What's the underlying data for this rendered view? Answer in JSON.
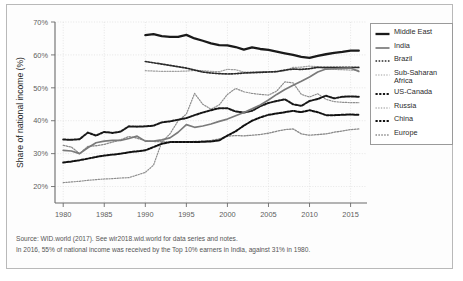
{
  "chart_data": {
    "type": "line",
    "title": "",
    "xlabel": "",
    "ylabel": "Share of national income (%)",
    "xlim": [
      1979,
      2017
    ],
    "ylim": [
      15,
      70
    ],
    "yticks": [
      20,
      30,
      40,
      50,
      60,
      70
    ],
    "ytick_labels": [
      "20%",
      "30%",
      "40%",
      "50%",
      "60%",
      "70%"
    ],
    "xticks": [
      1980,
      1985,
      1990,
      1995,
      2000,
      2005,
      2010,
      2015
    ],
    "xtick_labels": [
      "1980",
      "1985",
      "1990",
      "1995",
      "2000",
      "2005",
      "2010",
      "2015"
    ],
    "grid": true,
    "legend_position": "right",
    "series": [
      {
        "name": "Middle East",
        "style": "solid-thick",
        "color": "#1a1a1a",
        "x": [
          1990,
          1991,
          1992,
          1993,
          1994,
          1995,
          1996,
          1997,
          1998,
          1999,
          2000,
          2001,
          2002,
          2003,
          2004,
          2005,
          2006,
          2007,
          2008,
          2009,
          2010,
          2011,
          2012,
          2013,
          2014,
          2015,
          2016
        ],
        "values": [
          66.0,
          66.3,
          65.7,
          65.5,
          65.5,
          66.1,
          65.0,
          64.3,
          63.5,
          63.0,
          62.9,
          62.4,
          61.6,
          62.3,
          61.8,
          61.5,
          61.0,
          60.5,
          60.0,
          59.4,
          59.1,
          59.7,
          60.2,
          60.6,
          60.9,
          61.3,
          61.3
        ]
      },
      {
        "name": "India",
        "style": "solid-medium",
        "color": "#7a7a7a",
        "x": [
          1980,
          1981,
          1982,
          1983,
          1984,
          1985,
          1986,
          1987,
          1988,
          1989,
          1990,
          1991,
          1992,
          1993,
          1994,
          1995,
          1996,
          1997,
          1998,
          1999,
          2000,
          2001,
          2002,
          2003,
          2004,
          2005,
          2006,
          2007,
          2008,
          2009,
          2010,
          2011,
          2012,
          2013,
          2014,
          2015,
          2016
        ],
        "values": [
          31.0,
          30.8,
          30.0,
          31.8,
          33.3,
          33.8,
          34.0,
          34.0,
          34.6,
          35.3,
          33.8,
          33.8,
          34.2,
          34.8,
          36.5,
          38.8,
          38.0,
          38.4,
          39.0,
          39.8,
          40.5,
          41.5,
          42.5,
          43.6,
          44.8,
          46.3,
          48.0,
          49.5,
          50.8,
          52.0,
          53.3,
          54.8,
          55.7,
          55.8,
          55.9,
          56.0,
          55.0
        ]
      },
      {
        "name": "Brazil",
        "style": "dotted-bold",
        "color": "#2a2a2a",
        "x": [
          1990,
          1991,
          1992,
          1993,
          1994,
          1995,
          1996,
          1997,
          1998,
          1999,
          2000,
          2001,
          2002,
          2003,
          2004,
          2005,
          2006,
          2007,
          2008,
          2009,
          2010,
          2011,
          2012,
          2013,
          2014,
          2015,
          2016
        ],
        "values": [
          58.0,
          57.6,
          57.2,
          56.8,
          56.4,
          56.0,
          55.4,
          54.8,
          54.5,
          54.3,
          54.2,
          54.3,
          54.5,
          54.6,
          54.7,
          54.8,
          54.9,
          55.4,
          55.7,
          55.6,
          55.8,
          56.2,
          56.2,
          56.2,
          56.2,
          56.2,
          56.2
        ]
      },
      {
        "name": "Sub-Saharan Africa",
        "style": "dotted-light",
        "color": "#9f9f9f",
        "x": [
          1990,
          1991,
          1992,
          1993,
          1994,
          1995,
          1996,
          1997,
          1998,
          1999,
          2000,
          2001,
          2002,
          2003,
          2004,
          2005,
          2006,
          2007,
          2008,
          2009,
          2010,
          2011,
          2012,
          2013,
          2014,
          2015,
          2016
        ],
        "values": [
          55.2,
          55.1,
          55.0,
          55.0,
          55.0,
          55.1,
          55.3,
          55.2,
          55.0,
          54.9,
          55.6,
          55.5,
          54.8,
          54.8,
          54.9,
          54.9,
          55.0,
          55.2,
          56.2,
          56.3,
          56.6,
          56.4,
          55.8,
          55.6,
          55.5,
          55.4,
          55.3
        ]
      },
      {
        "name": "US-Canada",
        "style": "dashed-bold",
        "color": "#181818",
        "x": [
          1980,
          1981,
          1982,
          1983,
          1984,
          1985,
          1986,
          1987,
          1988,
          1989,
          1990,
          1991,
          1992,
          1993,
          1994,
          1995,
          1996,
          1997,
          1998,
          1999,
          2000,
          2001,
          2002,
          2003,
          2004,
          2005,
          2006,
          2007,
          2008,
          2009,
          2010,
          2011,
          2012,
          2013,
          2014,
          2015,
          2016
        ],
        "values": [
          34.3,
          34.2,
          34.4,
          36.4,
          35.5,
          36.6,
          36.3,
          36.7,
          38.3,
          38.2,
          38.3,
          38.5,
          39.5,
          39.8,
          40.3,
          40.8,
          41.7,
          42.5,
          43.2,
          43.8,
          43.8,
          42.8,
          42.5,
          43.0,
          44.4,
          45.4,
          46.0,
          46.5,
          45.0,
          44.5,
          46.0,
          46.6,
          47.6,
          46.8,
          47.3,
          47.4,
          47.3
        ]
      },
      {
        "name": "Russia",
        "style": "dotted-light",
        "color": "#8e8e8e",
        "x": [
          1980,
          1981,
          1982,
          1983,
          1984,
          1985,
          1986,
          1987,
          1988,
          1989,
          1990,
          1991,
          1992,
          1993,
          1994,
          1995,
          1996,
          1997,
          1998,
          1999,
          2000,
          2001,
          2002,
          2003,
          2004,
          2005,
          2006,
          2007,
          2008,
          2009,
          2010,
          2011,
          2012,
          2013,
          2014,
          2015,
          2016
        ],
        "values": [
          21.2,
          21.4,
          21.6,
          21.9,
          22.1,
          22.3,
          22.4,
          22.6,
          22.7,
          23.5,
          24.3,
          26.5,
          33.5,
          36.0,
          40.0,
          42.0,
          48.3,
          45.0,
          43.5,
          44.8,
          48.0,
          49.8,
          48.8,
          48.3,
          48.0,
          47.8,
          49.0,
          51.8,
          51.5,
          48.0,
          47.2,
          48.2,
          46.5,
          45.8,
          45.6,
          45.5,
          45.5
        ]
      },
      {
        "name": "China",
        "style": "dashed-bold",
        "color": "#111111",
        "x": [
          1980,
          1981,
          1982,
          1983,
          1984,
          1985,
          1986,
          1987,
          1988,
          1989,
          1990,
          1991,
          1992,
          1993,
          1994,
          1995,
          1996,
          1997,
          1998,
          1999,
          2000,
          2001,
          2002,
          2003,
          2004,
          2005,
          2006,
          2007,
          2008,
          2009,
          2010,
          2011,
          2012,
          2013,
          2014,
          2015,
          2016
        ],
        "values": [
          27.3,
          27.6,
          28.0,
          28.5,
          29.0,
          29.4,
          29.7,
          30.0,
          30.4,
          30.7,
          31.0,
          32.0,
          33.0,
          33.5,
          33.5,
          33.5,
          33.5,
          33.6,
          33.7,
          34.0,
          35.5,
          36.8,
          38.5,
          40.0,
          41.0,
          41.8,
          42.2,
          42.6,
          43.0,
          42.6,
          43.2,
          42.6,
          41.7,
          41.7,
          41.8,
          41.9,
          41.8
        ]
      },
      {
        "name": "Europe",
        "style": "dotted-medium",
        "color": "#8a8a8a",
        "x": [
          1980,
          1981,
          1982,
          1983,
          1984,
          1985,
          1986,
          1987,
          1988,
          1989,
          1990,
          1991,
          1992,
          1993,
          1994,
          1995,
          1996,
          1997,
          1998,
          1999,
          2000,
          2001,
          2002,
          2003,
          2004,
          2005,
          2006,
          2007,
          2008,
          2009,
          2010,
          2011,
          2012,
          2013,
          2014,
          2015,
          2016
        ],
        "values": [
          32.5,
          32.0,
          30.0,
          32.2,
          32.4,
          32.8,
          33.5,
          34.2,
          35.2,
          34.7,
          33.9,
          33.7,
          33.6,
          33.5,
          33.5,
          33.6,
          33.7,
          33.8,
          34.0,
          34.5,
          35.3,
          35.5,
          35.4,
          35.6,
          35.8,
          36.2,
          36.8,
          37.3,
          37.5,
          36.0,
          35.6,
          35.8,
          36.0,
          36.5,
          36.9,
          37.3,
          37.5
        ]
      }
    ]
  },
  "legend": {
    "items": [
      {
        "label": "Middle East",
        "style": "solid-thick",
        "color": "#1a1a1a"
      },
      {
        "label": "India",
        "style": "solid-medium",
        "color": "#7a7a7a"
      },
      {
        "label": "Brazil",
        "style": "dotted-bold",
        "color": "#2a2a2a"
      },
      {
        "label": "Sub-Saharan\nAfrica",
        "style": "dotted-light",
        "color": "#9f9f9f"
      },
      {
        "label": "US-Canada",
        "style": "dashed-bold",
        "color": "#181818"
      },
      {
        "label": "Russia",
        "style": "dotted-light",
        "color": "#8e8e8e"
      },
      {
        "label": "China",
        "style": "dashed-bold",
        "color": "#111111"
      },
      {
        "label": "Europe",
        "style": "dotted-medium",
        "color": "#8a8a8a"
      }
    ]
  },
  "caption": {
    "line1": "Source: WID.world (2017). See wir2018.wid.world for data series and notes.",
    "line2": "In 2016, 55% of national income was received by the Top 10% earners in India, against 31% in 1980."
  },
  "colors": {
    "axis": "#6b6b6b",
    "grid": "#dcdcdc",
    "text": "#5d5d5d",
    "frame": "#b9b9b9"
  }
}
